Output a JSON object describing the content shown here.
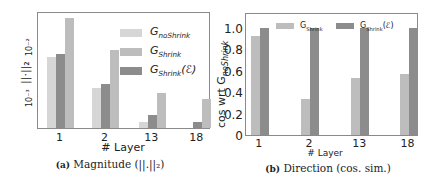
{
  "chart_data": [
    {
      "type": "bar",
      "panel": "a",
      "title": "",
      "caption_label": "(a)",
      "caption_text": "Magnitude (||.||₂)",
      "xlabel": "# Layer",
      "ylabel": "||·||₂",
      "yscale": "log",
      "yticks": [
        "10⁻³",
        "10⁻²"
      ],
      "categories": [
        "1",
        "2",
        "13",
        "18"
      ],
      "series": [
        {
          "name": "G_noShrink",
          "color": "#d6d6d6",
          "values": [
            0.0062,
            0.0015,
            0.00032,
            0.00023
          ]
        },
        {
          "name": "G_Shrink",
          "color": "#bdbdbd",
          "values": [
            0.035,
            0.0082,
            0.0012,
            0.0009
          ]
        },
        {
          "name": "G_Shrink(ℰ)",
          "color": "#8c8c8c",
          "values": [
            0.0071,
            0.0018,
            0.00045,
            0.00033
          ]
        }
      ],
      "legend_position": "upper right",
      "grid": false
    },
    {
      "type": "bar",
      "panel": "b",
      "title": "",
      "caption_label": "(b)",
      "caption_text": "Direction (cos. sim.)",
      "xlabel": "# Layer",
      "ylabel": "cos wrt G_noShrink",
      "ylim": [
        0,
        1.15
      ],
      "yticks": [
        "0",
        "0.2",
        "0.4",
        "0.6",
        "0.8",
        "1.0"
      ],
      "categories": [
        "1",
        "2",
        "13",
        "18"
      ],
      "series": [
        {
          "name": "G_Shrink",
          "color": "#bdbdbd",
          "values": [
            0.93,
            0.34,
            0.53,
            0.57
          ]
        },
        {
          "name": "G_Shrink(ℰ)",
          "color": "#8c8c8c",
          "values": [
            1.0,
            1.0,
            1.0,
            1.0
          ]
        }
      ],
      "legend_position": "upper center",
      "grid": false
    }
  ],
  "left": {
    "xlabel": "# Layer",
    "ylabel": "||·||₂",
    "ytick_top": "10⁻²",
    "ytick_bottom": "10⁻³",
    "categories": [
      "1",
      "2",
      "13",
      "18"
    ],
    "legend": [
      {
        "base": "G",
        "sub": "noShrink",
        "suffix": ""
      },
      {
        "base": "G",
        "sub": "Shrink",
        "suffix": ""
      },
      {
        "base": "G",
        "sub": "Shrink",
        "suffix": "(ℰ)"
      }
    ],
    "caption_label": "(a)",
    "caption_text": "Magnitude (||.||₂)"
  },
  "right": {
    "xlabel": "# Layer",
    "ylabel": "cos wrt G",
    "ylabel_sub": "noShrink",
    "yticks": [
      "0",
      "0.2",
      "0.4",
      "0.6",
      "0.8",
      "1.0"
    ],
    "categories": [
      "1",
      "2",
      "13",
      "18"
    ],
    "legend": [
      {
        "base": "G",
        "sub": "Shrink",
        "suffix": ""
      },
      {
        "base": "G",
        "sub": "Shrink",
        "suffix": "(ℰ)"
      }
    ],
    "caption_label": "(b)",
    "caption_text": "Direction (cos. sim.)"
  }
}
